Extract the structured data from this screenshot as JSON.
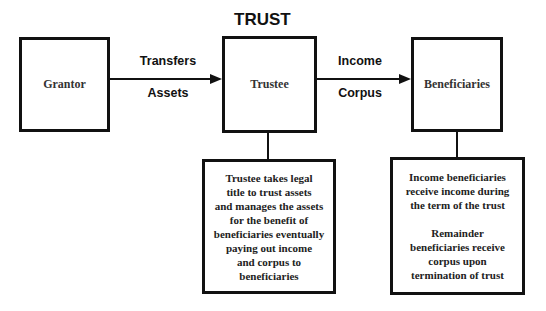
{
  "diagram": {
    "title": "TRUST",
    "nodes": {
      "grantor": "Grantor",
      "trustee": "Trustee",
      "beneficiaries": "Beneficiaries"
    },
    "edges": {
      "grantor_to_trustee": {
        "top": "Transfers",
        "bottom": "Assets"
      },
      "trustee_to_beneficiaries": {
        "top": "Income",
        "bottom": "Corpus"
      }
    },
    "notes": {
      "trustee": [
        "Trustee takes legal",
        "title to trust assets",
        "and manages the assets",
        "for the benefit of",
        "beneficiaries eventually",
        "paying out income",
        "and corpus to",
        "beneficiaries"
      ],
      "beneficiaries_income": [
        "Income beneficiaries",
        "receive income during",
        "the term of the trust"
      ],
      "beneficiaries_remainder": [
        "Remainder",
        "beneficiaries receive",
        "corpus upon",
        "termination of trust"
      ]
    }
  }
}
